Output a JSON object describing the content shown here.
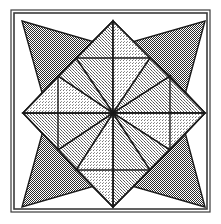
{
  "figure": {
    "kind": "geometric-line-drawing",
    "width": 221,
    "height": 224,
    "background_color": "#ffffff",
    "line_color": "#1a1a1a",
    "frame": {
      "outer": {
        "x": 11,
        "y": 10,
        "width": 199,
        "height": 202
      },
      "inner": {
        "x": 14,
        "y": 13,
        "width": 193,
        "height": 196
      },
      "stroke_color": "#3a3a3a",
      "outer_stroke_width": 1.2,
      "inner_stroke_width": 1.6
    },
    "center": {
      "x": 113,
      "y": 113
    },
    "palette": {
      "white": "#ffffff",
      "pale": "#ececed",
      "light": "#dcdcdd",
      "medium": "#c9c9ca",
      "dark": "#7d7d7e",
      "outline": "#1a1a1a"
    },
    "tones": [
      {
        "name": "white",
        "label": "plain white ground",
        "fill": "#ffffff",
        "dither_percent": 0
      },
      {
        "name": "pale",
        "label": "pale stipple",
        "fill": "#ececed",
        "dither_percent": 12
      },
      {
        "name": "light",
        "label": "light stipple",
        "fill": "#dcdcdd",
        "dither_percent": 22
      },
      {
        "name": "medium",
        "label": "medium stipple",
        "fill": "#c9c9ca",
        "dither_percent": 32
      },
      {
        "name": "dark",
        "label": "dark checkerboard",
        "fill": "#7d7d7e",
        "dither_percent": 50
      }
    ],
    "geometry": {
      "square": {
        "left": 22,
        "top": 21,
        "right": 205,
        "bottom": 207
      },
      "mid_x": 113,
      "mid_y": 113,
      "diamond_tip_inset": 23,
      "notes": "Four dark triangles spring from the square corners; four pale diamonds lie on the axes; eight medium kites radiate from the centre."
    },
    "shapes": [
      {
        "id": "diamond-north",
        "name": "pale-diamond-north",
        "tone": "pale",
        "points": "113,21 150,58 113,113 76,58"
      },
      {
        "id": "diamond-south",
        "name": "pale-diamond-south",
        "tone": "pale",
        "points": "113,207 76,170 113,113 150,170"
      },
      {
        "id": "diamond-west",
        "name": "pale-diamond-west",
        "tone": "pale",
        "points": "23,113 58,76 113,113 58,150"
      },
      {
        "id": "diamond-east",
        "name": "pale-diamond-east",
        "tone": "pale",
        "points": "205,113 170,150 113,113 170,76"
      },
      {
        "id": "triangle-nw",
        "name": "dark-triangle-northwest",
        "tone": "dark",
        "points": "22,21 150,58 58,150"
      },
      {
        "id": "triangle-ne",
        "name": "dark-triangle-northeast",
        "tone": "dark",
        "points": "205,21 170,150 76,58"
      },
      {
        "id": "triangle-se",
        "name": "dark-triangle-southeast",
        "tone": "dark",
        "points": "205,207 76,170 170,76"
      },
      {
        "id": "triangle-sw",
        "name": "dark-triangle-southwest",
        "tone": "dark",
        "points": "22,207 58,76 150,170"
      },
      {
        "id": "kite-n-left",
        "name": "medium-kite-north-left",
        "tone": "medium",
        "points": "113,113 76,58 113,21"
      },
      {
        "id": "kite-n-right",
        "name": "medium-kite-north-right",
        "tone": "light",
        "points": "113,113 113,21 150,58"
      },
      {
        "id": "kite-e-top",
        "name": "medium-kite-east-top",
        "tone": "medium",
        "points": "113,113 170,76 205,113"
      },
      {
        "id": "kite-e-bottom",
        "name": "medium-kite-east-bottom",
        "tone": "light",
        "points": "113,113 205,113 170,150"
      },
      {
        "id": "kite-s-right",
        "name": "medium-kite-south-right",
        "tone": "medium",
        "points": "113,113 150,170 113,207"
      },
      {
        "id": "kite-s-left",
        "name": "medium-kite-south-left",
        "tone": "light",
        "points": "113,113 113,207 76,170"
      },
      {
        "id": "kite-w-bottom",
        "name": "medium-kite-west-bottom",
        "tone": "medium",
        "points": "113,113 58,150 23,113"
      },
      {
        "id": "kite-w-top",
        "name": "medium-kite-west-top",
        "tone": "light",
        "points": "113,113 23,113 58,76"
      },
      {
        "id": "spoke-nne",
        "name": "medium-spoke-north-northeast",
        "tone": "medium",
        "points": "113,113 150,58 170,76"
      },
      {
        "id": "spoke-ese",
        "name": "medium-spoke-east-southeast",
        "tone": "medium",
        "points": "113,113 170,150 150,170"
      },
      {
        "id": "spoke-ssw",
        "name": "medium-spoke-south-southwest",
        "tone": "medium",
        "points": "113,113 76,170 58,150"
      },
      {
        "id": "spoke-wnw",
        "name": "medium-spoke-west-northwest",
        "tone": "medium",
        "points": "113,113 58,76 76,58"
      }
    ],
    "radial_lines": [
      {
        "name": "ray-north",
        "x1": 113,
        "y1": 113,
        "x2": 113,
        "y2": 21
      },
      {
        "name": "ray-northeast",
        "x1": 113,
        "y1": 113,
        "x2": 170,
        "y2": 76
      },
      {
        "name": "ray-east",
        "x1": 113,
        "y1": 113,
        "x2": 205,
        "y2": 113
      },
      {
        "name": "ray-southeast",
        "x1": 113,
        "y1": 113,
        "x2": 170,
        "y2": 150
      },
      {
        "name": "ray-south",
        "x1": 113,
        "y1": 113,
        "x2": 113,
        "y2": 207
      },
      {
        "name": "ray-southwest",
        "x1": 113,
        "y1": 113,
        "x2": 58,
        "y2": 150
      },
      {
        "name": "ray-west",
        "x1": 113,
        "y1": 113,
        "x2": 23,
        "y2": 113
      },
      {
        "name": "ray-northwest",
        "x1": 113,
        "y1": 113,
        "x2": 58,
        "y2": 76
      }
    ],
    "chord_lines": [
      {
        "name": "chord-nw-ne",
        "x1": 76,
        "y1": 58,
        "x2": 150,
        "y2": 58
      },
      {
        "name": "chord-ne-se",
        "x1": 170,
        "y1": 76,
        "x2": 170,
        "y2": 150
      },
      {
        "name": "chord-se-sw",
        "x1": 150,
        "y1": 170,
        "x2": 76,
        "y2": 170
      },
      {
        "name": "chord-sw-nw",
        "x1": 58,
        "y1": 150,
        "x2": 58,
        "y2": 76
      },
      {
        "name": "chord-n-w",
        "x1": 113,
        "y1": 21,
        "x2": 23,
        "y2": 113
      },
      {
        "name": "chord-n-e",
        "x1": 113,
        "y1": 21,
        "x2": 205,
        "y2": 113
      },
      {
        "name": "chord-s-w",
        "x1": 113,
        "y1": 207,
        "x2": 23,
        "y2": 113
      },
      {
        "name": "chord-s-e",
        "x1": 113,
        "y1": 207,
        "x2": 205,
        "y2": 113
      }
    ]
  }
}
